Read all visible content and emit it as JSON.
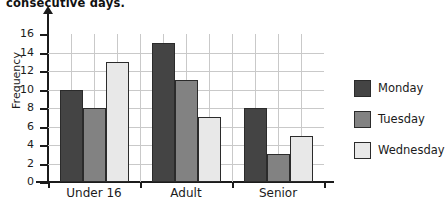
{
  "page": {
    "cut_off_heading": "consecutive days."
  },
  "legend": {
    "position": "right",
    "items": [
      {
        "label": "Monday",
        "color": "#444444"
      },
      {
        "label": "Tuesday",
        "color": "#828282"
      },
      {
        "label": "Wednesday",
        "color": "#e8e8e8"
      }
    ]
  },
  "chart_data": {
    "type": "bar",
    "title": "",
    "xlabel": "",
    "ylabel": "Frequency",
    "categories": [
      "Under 16",
      "Adult",
      "Senior"
    ],
    "series": [
      {
        "name": "Monday",
        "color": "#444444",
        "values": [
          10,
          15,
          8
        ]
      },
      {
        "name": "Tuesday",
        "color": "#828282",
        "values": [
          8,
          11,
          3
        ]
      },
      {
        "name": "Wednesday",
        "color": "#e8e8e8",
        "values": [
          13,
          7,
          5
        ]
      }
    ],
    "ylim": [
      0,
      16
    ],
    "ytick_step": 2,
    "yticks": [
      0,
      2,
      4,
      6,
      8,
      10,
      12,
      14,
      16
    ],
    "grid": true,
    "grid_axis": "both"
  }
}
